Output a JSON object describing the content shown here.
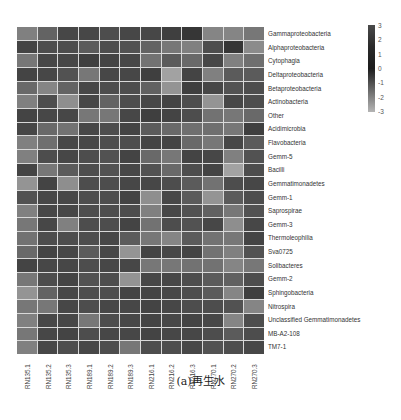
{
  "chart_data": {
    "type": "heatmap",
    "title": "",
    "caption": "(a)再生水",
    "xlabel": "",
    "ylabel": "",
    "columns": [
      "RN135.1",
      "RN135.2",
      "RN135.3",
      "RN189.1",
      "RN189.2",
      "RN189.3",
      "RN216.1",
      "RN216.2",
      "RN216.3",
      "RN270.1",
      "RN270.2",
      "RN270.3"
    ],
    "rows": [
      "Gammaproteobacteria",
      "Alphaproteobacteria",
      "Cytophagia",
      "Deltaproteobacteria",
      "Betaproteobacteria",
      "Actinobacteria",
      "Other",
      "Acidimicrobia",
      "Flavobacteria",
      "Gemm-5",
      "Bacilli",
      "Gemmatimonadetes",
      "Gemm-1",
      "Saprospirae",
      "Gemm-3",
      "Thermoleophilia",
      "Sva0725",
      "Solibacteres",
      "Gemm-2",
      "Sphingobacteria",
      "Nitrospira",
      "Unclassified Gemmatimonadetes",
      "MB-A2-108",
      "TM7-1"
    ],
    "values": [
      [
        -0.8,
        0.2,
        1.2,
        1.2,
        1.0,
        1.2,
        1.2,
        1.5,
        1.8,
        -1.0,
        -1.0,
        -0.5
      ],
      [
        1.3,
        1.0,
        1.0,
        0.5,
        1.0,
        0.8,
        0.2,
        -0.5,
        -0.8,
        1.0,
        1.8,
        -1.2
      ],
      [
        -0.5,
        1.2,
        1.2,
        1.5,
        1.3,
        1.2,
        -0.3,
        0.5,
        0.0,
        1.2,
        -0.8,
        -0.2
      ],
      [
        1.3,
        1.2,
        0.8,
        -0.5,
        1.2,
        1.2,
        1.5,
        -2.0,
        1.3,
        -0.8,
        0.5,
        0.5
      ],
      [
        0.0,
        -1.0,
        0.2,
        1.2,
        1.0,
        1.0,
        0.3,
        -1.5,
        1.5,
        1.2,
        0.8,
        1.0
      ],
      [
        -0.8,
        1.0,
        -1.3,
        1.2,
        0.2,
        1.0,
        1.2,
        1.3,
        1.0,
        -1.5,
        1.2,
        1.0
      ],
      [
        1.3,
        1.2,
        1.2,
        -0.5,
        -0.5,
        1.2,
        1.5,
        1.3,
        1.0,
        -0.3,
        -0.5,
        0.0
      ],
      [
        1.2,
        0.0,
        -0.3,
        1.2,
        1.0,
        1.3,
        0.5,
        0.0,
        -0.2,
        -0.2,
        -0.5,
        1.5
      ],
      [
        -0.8,
        -0.2,
        1.2,
        1.2,
        1.0,
        1.0,
        1.3,
        1.3,
        0.0,
        -0.5,
        1.2,
        0.5
      ],
      [
        -0.8,
        1.0,
        1.2,
        1.0,
        0.8,
        1.3,
        0.0,
        -0.5,
        1.3,
        1.2,
        -0.8,
        0.8
      ],
      [
        1.3,
        -0.5,
        0.5,
        1.0,
        0.8,
        1.2,
        0.8,
        0.0,
        1.0,
        1.3,
        -2.0,
        1.0
      ],
      [
        -1.5,
        1.3,
        -1.3,
        1.0,
        1.0,
        1.2,
        1.2,
        1.0,
        0.5,
        -0.3,
        1.0,
        1.2
      ],
      [
        0.8,
        1.2,
        1.2,
        1.0,
        1.0,
        1.3,
        -1.3,
        1.2,
        0.5,
        -1.5,
        0.5,
        1.0
      ],
      [
        -0.8,
        1.2,
        1.2,
        1.0,
        1.0,
        1.0,
        -0.8,
        1.2,
        0.8,
        0.3,
        -0.5,
        0.8
      ],
      [
        -0.5,
        1.2,
        -0.8,
        1.0,
        1.0,
        1.3,
        -0.3,
        1.0,
        0.8,
        1.2,
        -1.3,
        1.2
      ],
      [
        -0.3,
        1.0,
        1.0,
        1.0,
        1.2,
        0.5,
        -0.5,
        -1.0,
        0.5,
        -0.3,
        -0.5,
        1.3
      ],
      [
        0.0,
        1.3,
        1.2,
        0.5,
        1.2,
        -1.5,
        1.3,
        1.2,
        1.3,
        -0.3,
        -0.8,
        0.8
      ],
      [
        1.3,
        1.2,
        1.2,
        1.0,
        1.2,
        1.2,
        -0.5,
        -0.5,
        -0.3,
        -0.3,
        -1.0,
        -0.5
      ],
      [
        -0.5,
        1.0,
        1.3,
        0.8,
        1.0,
        -1.5,
        1.2,
        1.2,
        1.0,
        0.5,
        0.3,
        1.0
      ],
      [
        -1.5,
        0.2,
        1.2,
        1.0,
        1.0,
        1.3,
        1.3,
        1.2,
        1.0,
        0.5,
        -1.0,
        1.5
      ],
      [
        -0.5,
        -0.5,
        1.2,
        1.0,
        1.2,
        1.2,
        1.3,
        1.2,
        1.0,
        1.0,
        0.8,
        -1.0
      ],
      [
        -0.8,
        1.2,
        1.2,
        -0.5,
        1.0,
        1.2,
        1.3,
        1.2,
        1.3,
        1.2,
        -1.0,
        1.0
      ],
      [
        -0.5,
        1.2,
        1.3,
        1.0,
        1.2,
        1.2,
        1.3,
        1.2,
        1.2,
        1.0,
        0.5,
        1.0
      ],
      [
        -0.8,
        1.2,
        1.0,
        1.2,
        1.0,
        -0.5,
        1.0,
        1.0,
        1.2,
        0.8,
        1.0,
        1.2
      ]
    ],
    "colorbar": {
      "min": -3,
      "max": 3,
      "ticks": [
        "3",
        "2",
        "1",
        "0",
        "-1",
        "-2",
        "-3"
      ],
      "scheme": "grayscale (dark = high)"
    },
    "legend_position": "top-right",
    "grid": true
  },
  "footer_partial": "…的群落构成比较研究…"
}
